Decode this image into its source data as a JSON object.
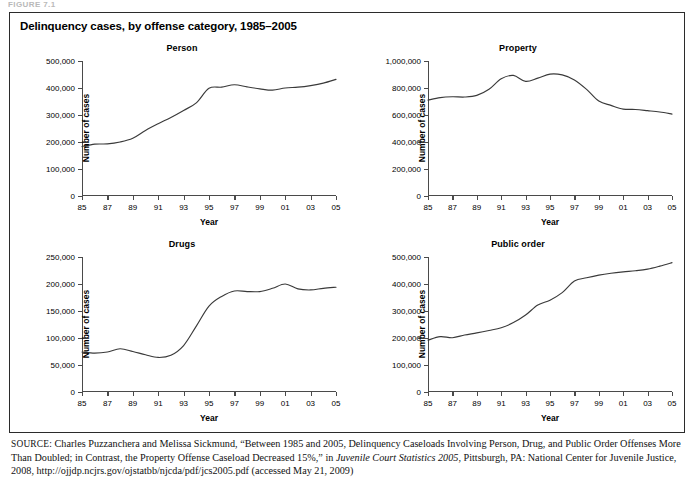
{
  "top_caption": "FIGURE 7.1",
  "figure": {
    "title": "Delinquency cases, by offense category, 1985–2005",
    "axis_title_x": "Year",
    "axis_title_y": "Number of cases"
  },
  "source": {
    "label": "SOURCE:",
    "text_before_italic": " Charles Puzzanchera and Melissa Sickmund, “Between 1985 and 2005, Delinquency Caseloads Involving Person, Drug, and Public Order Offenses More Than Doubled; in Contrast, the Property Offense Caseload Decreased 15%,” in ",
    "italic_title": "Juvenile Court Statistics 2005",
    "text_after_italic": ", Pittsburgh, PA: National Center for Juvenile Justice, 2008, http://ojjdp.ncjrs.gov/ojstatbb/njcda/pdf/jcs2005.pdf (accessed May 21, 2009)"
  },
  "colors": {
    "line": "#3a3a3a",
    "axis": "#4a4a4a",
    "border": "#2b2b2b",
    "background": "#ffffff"
  },
  "chart_data": [
    {
      "type": "line",
      "title": "Person",
      "xlabel": "Year",
      "ylabel": "Number of cases",
      "grid": false,
      "legend": "none",
      "xlim": [
        1985,
        2005
      ],
      "ylim": [
        0,
        500000
      ],
      "yticks": [
        0,
        100000,
        200000,
        300000,
        400000,
        500000
      ],
      "ytick_labels": [
        "0",
        "100,000",
        "200,000",
        "300,000",
        "400,000",
        "500,000"
      ],
      "xticks": [
        1985,
        1987,
        1989,
        1991,
        1993,
        1995,
        1997,
        1999,
        2001,
        2003,
        2005
      ],
      "xtick_labels": [
        "85",
        "87",
        "89",
        "91",
        "93",
        "95",
        "97",
        "99",
        "01",
        "03",
        "05"
      ],
      "x": [
        1985,
        1986,
        1987,
        1988,
        1989,
        1990,
        1991,
        1992,
        1993,
        1994,
        1995,
        1996,
        1997,
        1998,
        1999,
        2000,
        2001,
        2002,
        2003,
        2004,
        2005
      ],
      "values": [
        183000,
        192000,
        193000,
        200000,
        214000,
        243000,
        268000,
        291000,
        317000,
        345000,
        399000,
        403000,
        412000,
        404000,
        397000,
        392000,
        400000,
        403000,
        409000,
        418000,
        432000
      ]
    },
    {
      "type": "line",
      "title": "Property",
      "xlabel": "Year",
      "ylabel": "Number of cases",
      "grid": false,
      "legend": "none",
      "xlim": [
        1985,
        2005
      ],
      "ylim": [
        0,
        1000000
      ],
      "yticks": [
        0,
        200000,
        400000,
        600000,
        800000,
        1000000
      ],
      "ytick_labels": [
        "0",
        "200,000",
        "400,000",
        "600,000",
        "800,000",
        "1,000,000"
      ],
      "xticks": [
        1985,
        1987,
        1989,
        1991,
        1993,
        1995,
        1997,
        1999,
        2001,
        2003,
        2005
      ],
      "xtick_labels": [
        "85",
        "87",
        "89",
        "91",
        "93",
        "95",
        "97",
        "99",
        "01",
        "03",
        "05"
      ],
      "x": [
        1985,
        1986,
        1987,
        1988,
        1989,
        1990,
        1991,
        1992,
        1993,
        1994,
        1995,
        1996,
        1997,
        1998,
        1999,
        2000,
        2001,
        2002,
        2003,
        2004,
        2005
      ],
      "values": [
        710000,
        729000,
        735000,
        733000,
        745000,
        790000,
        868000,
        893000,
        849000,
        873000,
        903000,
        897000,
        860000,
        790000,
        703000,
        671000,
        644000,
        641000,
        632000,
        622000,
        607000
      ]
    },
    {
      "type": "line",
      "title": "Drugs",
      "xlabel": "Year",
      "ylabel": "Number of cases",
      "grid": false,
      "legend": "none",
      "xlim": [
        1985,
        2005
      ],
      "ylim": [
        0,
        250000
      ],
      "yticks": [
        0,
        50000,
        100000,
        150000,
        200000,
        250000
      ],
      "ytick_labels": [
        "0",
        "50,000",
        "100,000",
        "150,000",
        "200,000",
        "250,000"
      ],
      "xticks": [
        1985,
        1987,
        1989,
        1991,
        1993,
        1995,
        1997,
        1999,
        2001,
        2003,
        2005
      ],
      "xtick_labels": [
        "85",
        "87",
        "89",
        "91",
        "93",
        "95",
        "97",
        "99",
        "01",
        "03",
        "05"
      ],
      "x": [
        1985,
        1986,
        1987,
        1988,
        1989,
        1990,
        1991,
        1992,
        1993,
        1994,
        1995,
        1996,
        1997,
        1998,
        1999,
        2000,
        2001,
        2002,
        2003,
        2004,
        2005
      ],
      "values": [
        74000,
        72000,
        74000,
        80000,
        75000,
        69000,
        64000,
        68000,
        86000,
        122000,
        159000,
        177000,
        187000,
        186000,
        186000,
        192000,
        200000,
        191000,
        189000,
        192000,
        194000
      ]
    },
    {
      "type": "line",
      "title": "Public order",
      "xlabel": "Year",
      "ylabel": "Number of cases",
      "grid": false,
      "legend": "none",
      "xlim": [
        1985,
        2005
      ],
      "ylim": [
        0,
        500000
      ],
      "yticks": [
        0,
        100000,
        200000,
        300000,
        400000,
        500000
      ],
      "ytick_labels": [
        "0",
        "100,000",
        "200,000",
        "300,000",
        "400,000",
        "500,000"
      ],
      "xticks": [
        1985,
        1987,
        1989,
        1991,
        1993,
        1995,
        1997,
        1999,
        2001,
        2003,
        2005
      ],
      "xtick_labels": [
        "85",
        "87",
        "89",
        "91",
        "93",
        "95",
        "97",
        "99",
        "01",
        "03",
        "05"
      ],
      "x": [
        1985,
        1986,
        1987,
        1988,
        1989,
        1990,
        1991,
        1992,
        1993,
        1994,
        1995,
        1996,
        1997,
        1998,
        1999,
        2000,
        2001,
        2002,
        2003,
        2004,
        2005
      ],
      "values": [
        192000,
        205000,
        201000,
        211000,
        219000,
        228000,
        238000,
        257000,
        285000,
        322000,
        340000,
        368000,
        411000,
        423000,
        433000,
        440000,
        445000,
        449000,
        455000,
        466000,
        479000
      ]
    }
  ]
}
